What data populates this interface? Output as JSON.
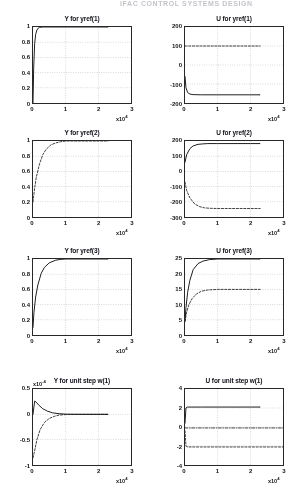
{
  "page": {
    "header_text": "IFAC CONTROL SYSTEMS DESIGN"
  },
  "figure": {
    "x_axis_multiplier": "x10",
    "x_axis_exponent": "4",
    "y_axis_multiplier": "x10",
    "y_axis_exponent_neg4": "-4"
  },
  "chart_data": [
    {
      "id": "y-yref-1",
      "type": "line",
      "title": "Y for yref(1)",
      "xlabel": "x10^4",
      "ylabel": "",
      "xlim": [
        0,
        3
      ],
      "ylim": [
        0,
        1
      ],
      "xticks": [
        "0",
        "1",
        "2",
        "3"
      ],
      "yticks": [
        "0",
        "0.2",
        "0.4",
        "0.6",
        "0.8",
        "1"
      ],
      "grid": true,
      "series": [
        {
          "name": "y1",
          "style": "solid",
          "x": [
            0,
            0.02,
            0.05,
            0.08,
            0.12,
            0.16,
            0.2,
            0.3,
            0.5,
            1.0,
            1.5,
            2.0,
            2.3
          ],
          "values": [
            0,
            0.45,
            0.78,
            0.9,
            0.96,
            0.985,
            0.995,
            1.0,
            1.0,
            1.0,
            1.0,
            1.0,
            1.0
          ]
        }
      ]
    },
    {
      "id": "u-yref-1",
      "type": "line",
      "title": "U for yref(1)",
      "xlabel": "x10^4",
      "ylabel": "",
      "xlim": [
        0,
        3
      ],
      "ylim": [
        -200,
        200
      ],
      "xticks": [
        "0",
        "1",
        "2",
        "3"
      ],
      "yticks": [
        "-200",
        "-100",
        "0",
        "100",
        "200"
      ],
      "grid": true,
      "series": [
        {
          "name": "u1-dashed",
          "style": "dashed",
          "x": [
            0,
            0.05,
            0.5,
            1.0,
            1.5,
            2.0,
            2.3
          ],
          "values": [
            100,
            100,
            100,
            100,
            100,
            100,
            100
          ]
        },
        {
          "name": "u1-solid",
          "style": "solid",
          "x": [
            0,
            0.03,
            0.08,
            0.15,
            0.25,
            0.5,
            1.0,
            1.5,
            2.0,
            2.3
          ],
          "values": [
            -60,
            -120,
            -145,
            -153,
            -156,
            -157,
            -157,
            -157,
            -157,
            -157
          ]
        }
      ]
    },
    {
      "id": "y-yref-2",
      "type": "line",
      "title": "Y for yref(2)",
      "xlabel": "x10^4",
      "ylabel": "",
      "xlim": [
        0,
        3
      ],
      "ylim": [
        0,
        1
      ],
      "xticks": [
        "0",
        "1",
        "2",
        "3"
      ],
      "yticks": [
        "0",
        "0.2",
        "0.4",
        "0.6",
        "0.8",
        "1"
      ],
      "grid": true,
      "series": [
        {
          "name": "y2",
          "style": "dashed",
          "x": [
            0,
            0.05,
            0.1,
            0.2,
            0.3,
            0.4,
            0.55,
            0.7,
            0.85,
            1.0,
            1.5,
            2.0,
            2.3
          ],
          "values": [
            0.2,
            0.38,
            0.52,
            0.7,
            0.82,
            0.89,
            0.95,
            0.975,
            0.99,
            1.0,
            1.0,
            1.0,
            1.0
          ]
        }
      ]
    },
    {
      "id": "u-yref-2",
      "type": "line",
      "title": "U for yref(2)",
      "xlabel": "x10^4",
      "ylabel": "",
      "xlim": [
        0,
        3
      ],
      "ylim": [
        -300,
        200
      ],
      "xticks": [
        "0",
        "1",
        "2",
        "3"
      ],
      "yticks": [
        "-300",
        "-200",
        "-100",
        "0",
        "100",
        "200"
      ],
      "grid": true,
      "series": [
        {
          "name": "u2-solid",
          "style": "solid",
          "x": [
            0,
            0.05,
            0.15,
            0.25,
            0.4,
            0.55,
            0.7,
            1.0,
            1.5,
            2.0,
            2.3
          ],
          "values": [
            60,
            110,
            150,
            168,
            178,
            181,
            183,
            183,
            183,
            183,
            183
          ]
        },
        {
          "name": "u2-dashed",
          "style": "dashed",
          "x": [
            0,
            0.05,
            0.15,
            0.3,
            0.45,
            0.6,
            0.8,
            1.0,
            1.5,
            2.0,
            2.3
          ],
          "values": [
            -70,
            -125,
            -175,
            -215,
            -232,
            -240,
            -243,
            -244,
            -244,
            -244,
            -244
          ]
        }
      ]
    },
    {
      "id": "y-yref-3",
      "type": "line",
      "title": "Y for yref(3)",
      "xlabel": "x10^4",
      "ylabel": "",
      "xlim": [
        0,
        3
      ],
      "ylim": [
        0,
        1
      ],
      "xticks": [
        "0",
        "1",
        "2",
        "3"
      ],
      "yticks": [
        "0",
        "0.2",
        "0.4",
        "0.6",
        "0.8",
        "1"
      ],
      "grid": true,
      "series": [
        {
          "name": "y3",
          "style": "solid",
          "x": [
            0,
            0.03,
            0.08,
            0.15,
            0.25,
            0.35,
            0.5,
            0.7,
            0.85,
            1.0,
            1.5,
            2.0,
            2.3
          ],
          "values": [
            0.1,
            0.3,
            0.5,
            0.66,
            0.81,
            0.89,
            0.95,
            0.985,
            0.995,
            1.0,
            1.0,
            1.0,
            1.0
          ]
        }
      ]
    },
    {
      "id": "u-yref-3",
      "type": "line",
      "title": "U for yref(3)",
      "xlabel": "x10^4",
      "ylabel": "",
      "xlim": [
        0,
        3
      ],
      "ylim": [
        0,
        25
      ],
      "xticks": [
        "0",
        "1",
        "2",
        "3"
      ],
      "yticks": [
        "0",
        "5",
        "10",
        "15",
        "20",
        "25"
      ],
      "grid": true,
      "series": [
        {
          "name": "u3-solid",
          "style": "solid",
          "x": [
            0,
            0.03,
            0.08,
            0.15,
            0.25,
            0.4,
            0.55,
            0.75,
            1.0,
            1.5,
            2.0,
            2.3
          ],
          "values": [
            4.5,
            9,
            14,
            18,
            21.5,
            23.5,
            24.3,
            24.8,
            25,
            25,
            25,
            25
          ]
        },
        {
          "name": "u3-dashed",
          "style": "dashed",
          "x": [
            0,
            0.05,
            0.12,
            0.22,
            0.35,
            0.5,
            0.7,
            1.0,
            1.5,
            2.0,
            2.3
          ],
          "values": [
            4.5,
            7.5,
            10,
            12,
            13.5,
            14.4,
            14.8,
            15,
            15,
            15,
            15
          ]
        }
      ]
    },
    {
      "id": "y-unit-step-w1",
      "type": "line",
      "title": "Y for unit step w(1)",
      "xlabel": "x10^4",
      "ylabel": "x10^-4",
      "xlim": [
        0,
        3
      ],
      "ylim": [
        -1,
        0.5
      ],
      "xticks": [
        "0",
        "1",
        "2",
        "3"
      ],
      "yticks": [
        "-1",
        "-0.5",
        "0",
        "0.5"
      ],
      "grid": true,
      "series": [
        {
          "name": "yw-solid",
          "style": "solid",
          "x": [
            0,
            0.05,
            0.1,
            0.18,
            0.3,
            0.45,
            0.6,
            0.8,
            1.0,
            1.5,
            2.0,
            2.3
          ],
          "values": [
            0.0,
            0.26,
            0.24,
            0.18,
            0.11,
            0.06,
            0.03,
            0.012,
            0.004,
            0.0,
            0.0,
            0.0
          ]
        },
        {
          "name": "yw-dashed",
          "style": "dashed",
          "x": [
            0,
            0.05,
            0.12,
            0.22,
            0.35,
            0.5,
            0.65,
            0.8,
            1.0,
            1.5,
            2.0,
            2.3
          ],
          "values": [
            -0.86,
            -0.72,
            -0.5,
            -0.3,
            -0.16,
            -0.08,
            -0.04,
            -0.015,
            -0.005,
            0.0,
            0.0,
            0.0
          ]
        }
      ]
    },
    {
      "id": "u-unit-step-w1",
      "type": "line",
      "title": "U for unit step w(1)",
      "xlabel": "x10^4",
      "ylabel": "",
      "xlim": [
        0,
        3
      ],
      "ylim": [
        -4,
        4
      ],
      "xticks": [
        "0",
        "1",
        "2",
        "3"
      ],
      "yticks": [
        "-4",
        "-2",
        "0",
        "2",
        "4"
      ],
      "grid": true,
      "series": [
        {
          "name": "uw-solid",
          "style": "solid",
          "x": [
            0,
            0.03,
            0.08,
            0.5,
            1.0,
            1.5,
            2.0,
            2.3
          ],
          "values": [
            0.4,
            2.0,
            2.1,
            2.1,
            2.1,
            2.1,
            2.1,
            2.1
          ]
        },
        {
          "name": "uw-dashed",
          "style": "dashed",
          "x": [
            0,
            0.03,
            0.08,
            0.5,
            1.0,
            1.5,
            2.0,
            2.3,
            3.0
          ],
          "values": [
            -0.4,
            -2.0,
            -2.1,
            -2.1,
            -2.1,
            -2.1,
            -2.1,
            -2.1,
            -2.1
          ]
        },
        {
          "name": "uw-zero",
          "style": "dashdot",
          "x": [
            0,
            1.0,
            2.0,
            3.0
          ],
          "values": [
            -0.1,
            -0.1,
            -0.1,
            -0.1
          ]
        }
      ]
    }
  ]
}
